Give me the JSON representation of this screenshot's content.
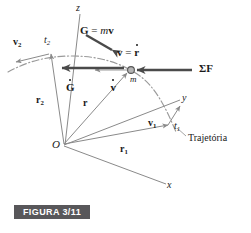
{
  "figure": {
    "caption": "FIGURA 3/11",
    "caption_bg": "#58575a",
    "caption_fg": "#ffffff",
    "background": "#ffffff"
  },
  "colors": {
    "thin_line": "#8a8a8a",
    "trajectory": "#9a9a9a",
    "heavy_arrow": "#4a4a4a",
    "text": "#1a1a1a",
    "particle_fill": "#b5b5b5",
    "particle_stroke": "#555555"
  },
  "axes": [
    {
      "name": "z-axis",
      "label": "z",
      "x": 76,
      "y": 3
    },
    {
      "name": "y-axis",
      "label": "y",
      "x": 182,
      "y": 93
    },
    {
      "name": "x-axis",
      "label": "x",
      "x": 167,
      "y": 180
    }
  ],
  "origin": {
    "label": "O",
    "x": 52,
    "y": 140
  },
  "particle": {
    "label": "m",
    "x": 130,
    "y": 76,
    "cx": 131,
    "cy": 70,
    "r": 3.4
  },
  "position_vectors": [
    {
      "name": "r-sub-2",
      "base": "r",
      "sub": "2",
      "x": 36,
      "y": 95
    },
    {
      "name": "r",
      "base": "r",
      "sub": "",
      "x": 83,
      "y": 98
    },
    {
      "name": "r-sub-1",
      "base": "r",
      "sub": "1",
      "x": 120,
      "y": 145
    }
  ],
  "velocity_vectors": [
    {
      "name": "v-sub-2",
      "base": "v",
      "sub": "2",
      "x": 13,
      "y": 38
    },
    {
      "name": "v-sub-1",
      "base": "v",
      "sub": "1",
      "x": 148,
      "y": 119
    }
  ],
  "time_marks": [
    {
      "name": "t-sub-2",
      "base": "t",
      "sub": "2",
      "x": 44,
      "y": 36
    },
    {
      "name": "t-sub-1",
      "base": "t",
      "sub": "1",
      "x": 174,
      "y": 122
    }
  ],
  "vector_labels": {
    "momentum": {
      "lhs": "G",
      "eq": " = ",
      "mass": "m",
      "vel": "v",
      "x": 80,
      "y": 26
    },
    "velocity": {
      "lhs": "v",
      "eq": " = ",
      "rhs": "r",
      "x": 117,
      "y": 48
    },
    "momentum_rate": {
      "glyph": "G",
      "x": 66,
      "y": 78
    },
    "accel": {
      "glyph": "v",
      "x": 98,
      "y": 78
    },
    "force": {
      "glyph": "ΣF",
      "x": 199,
      "y": 70
    }
  },
  "trajectory_label": {
    "text": "Trajetória",
    "x": 188,
    "y": 139
  }
}
